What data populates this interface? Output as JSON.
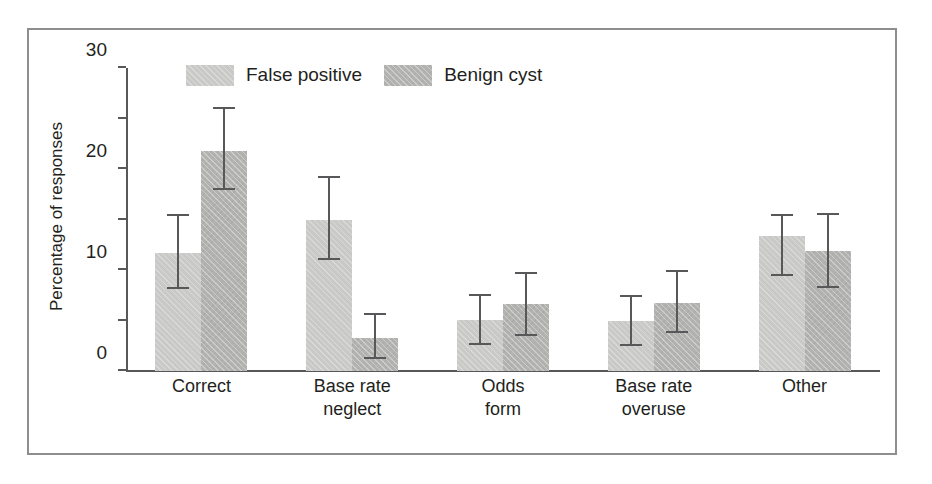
{
  "chart_data": {
    "type": "bar",
    "title": "",
    "subtitle": "",
    "xlabel": "",
    "ylabel": "Percentage of responses",
    "ylim": [
      0,
      60
    ],
    "yticks": [
      0,
      10,
      20,
      30,
      40,
      50,
      60
    ],
    "ytick_labels": [
      "0",
      "10",
      "20",
      "30",
      "40",
      "50",
      "60"
    ],
    "grid": false,
    "legend_position": "top-left-inside",
    "error_bars": "symmetric-capped",
    "categories": [
      "Correct",
      "Base rate neglect",
      "Odds form",
      "Base rate overuse",
      "Other"
    ],
    "category_lines": [
      [
        "Correct"
      ],
      [
        "Base rate",
        "neglect"
      ],
      [
        "Odds",
        "form"
      ],
      [
        "Base rate",
        "overuse"
      ],
      [
        "Other"
      ]
    ],
    "series": [
      {
        "name": "False positive",
        "color": "#c9c9c7",
        "values": [
          23.4,
          30.0,
          10.1,
          10.0,
          26.7
        ],
        "err_low": [
          16.2,
          22.0,
          5.2,
          5.0,
          18.8
        ],
        "err_high": [
          31.0,
          38.6,
          15.2,
          15.0,
          31.1
        ]
      },
      {
        "name": "Benign cyst",
        "color": "#b2b2b0",
        "values": [
          43.5,
          6.6,
          13.3,
          13.4,
          23.8
        ],
        "err_low": [
          35.8,
          2.3,
          7.0,
          7.5,
          16.4
        ],
        "err_high": [
          52.3,
          11.5,
          19.7,
          20.0,
          31.3
        ]
      }
    ]
  },
  "axis": {
    "line_color": "#58585a"
  },
  "frame": {
    "border_color": "#8e8e8e"
  }
}
